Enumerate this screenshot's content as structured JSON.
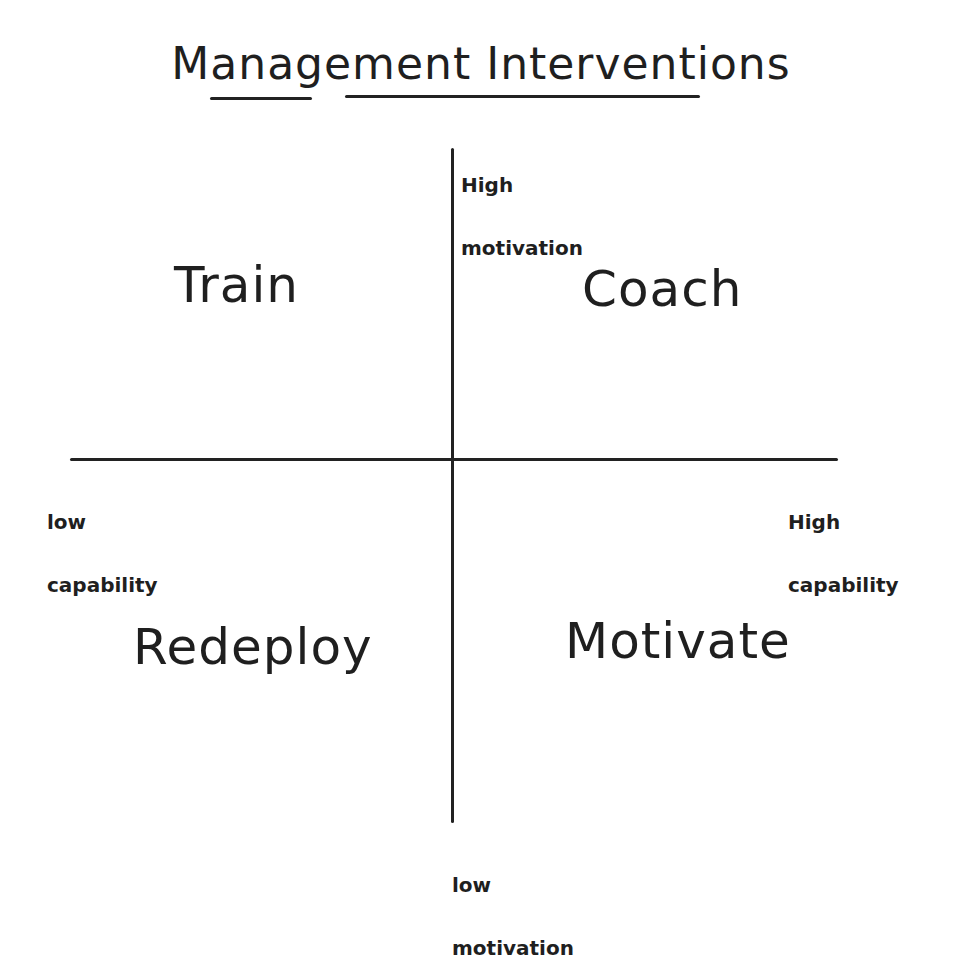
{
  "title": "Management Interventions",
  "axes": {
    "vertical": {
      "top_label_line1": "High",
      "top_label_line2": "motivation",
      "bottom_label_line1": "low",
      "bottom_label_line2": "motivation"
    },
    "horizontal": {
      "left_label_line1": "low",
      "left_label_line2": "capability",
      "right_label_line1": "High",
      "right_label_line2": "capability"
    }
  },
  "quadrants": {
    "top_left": "Train",
    "top_right": "Coach",
    "bottom_left": "Redeploy",
    "bottom_right": "Motivate"
  },
  "colors": {
    "ink": "#1f1f1f",
    "background": "#ffffff"
  }
}
